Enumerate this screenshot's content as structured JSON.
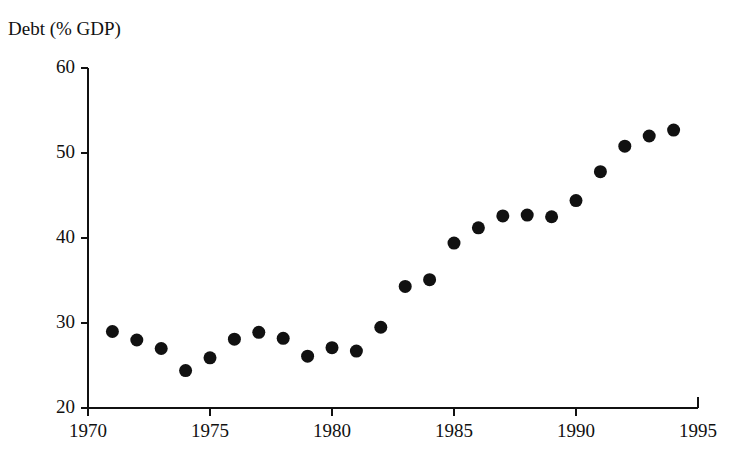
{
  "chart_data": {
    "type": "scatter",
    "title": "Debt (% GDP)",
    "xlabel": "",
    "ylabel": "Debt (% GDP)",
    "xlim": [
      1970,
      1995
    ],
    "ylim": [
      20,
      60
    ],
    "grid": false,
    "legend": null,
    "marker": {
      "shape": "circle",
      "color": "#111111",
      "size_px": 13
    },
    "xticks": [
      1970,
      1975,
      1980,
      1985,
      1990,
      1995
    ],
    "xtick_labels": [
      "1970",
      "1975",
      "1980",
      "1985",
      "1990",
      "1995"
    ],
    "yticks": [
      20,
      30,
      40,
      50,
      60
    ],
    "ytick_labels": [
      "20",
      "30",
      "40",
      "50",
      "60"
    ],
    "x": [
      1971,
      1972,
      1973,
      1974,
      1975,
      1976,
      1977,
      1978,
      1979,
      1980,
      1981,
      1982,
      1983,
      1984,
      1985,
      1986,
      1987,
      1988,
      1989,
      1990,
      1991,
      1992,
      1993,
      1994
    ],
    "values": [
      29.0,
      28.0,
      27.0,
      24.4,
      25.9,
      28.1,
      28.9,
      28.2,
      26.1,
      27.1,
      26.7,
      29.5,
      34.3,
      35.1,
      39.4,
      41.2,
      42.6,
      42.7,
      42.5,
      44.4,
      47.8,
      50.8,
      52.0,
      52.7
    ],
    "points": [
      {
        "year": 1971,
        "debt": 29.0
      },
      {
        "year": 1972,
        "debt": 28.0
      },
      {
        "year": 1973,
        "debt": 27.0
      },
      {
        "year": 1974,
        "debt": 24.4
      },
      {
        "year": 1975,
        "debt": 25.9
      },
      {
        "year": 1976,
        "debt": 28.1
      },
      {
        "year": 1977,
        "debt": 28.9
      },
      {
        "year": 1978,
        "debt": 28.2
      },
      {
        "year": 1979,
        "debt": 26.1
      },
      {
        "year": 1980,
        "debt": 27.1
      },
      {
        "year": 1981,
        "debt": 26.7
      },
      {
        "year": 1982,
        "debt": 29.5
      },
      {
        "year": 1983,
        "debt": 34.3
      },
      {
        "year": 1984,
        "debt": 35.1
      },
      {
        "year": 1985,
        "debt": 39.4
      },
      {
        "year": 1986,
        "debt": 41.2
      },
      {
        "year": 1987,
        "debt": 42.6
      },
      {
        "year": 1988,
        "debt": 42.7
      },
      {
        "year": 1989,
        "debt": 42.5
      },
      {
        "year": 1990,
        "debt": 44.4
      },
      {
        "year": 1991,
        "debt": 47.8
      },
      {
        "year": 1992,
        "debt": 50.8
      },
      {
        "year": 1993,
        "debt": 52.0
      },
      {
        "year": 1994,
        "debt": 52.7
      }
    ]
  },
  "axes": {
    "axis_color": "#111111",
    "background": "#ffffff"
  }
}
